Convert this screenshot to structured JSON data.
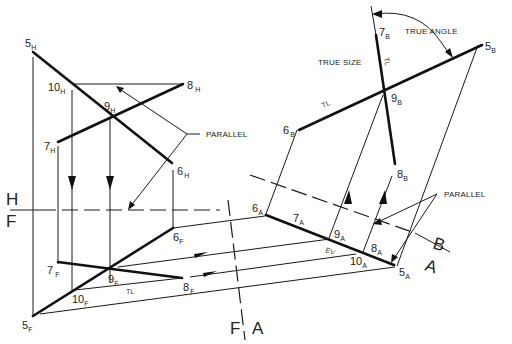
{
  "figure": {
    "views": {
      "horizontal": {
        "name": "H",
        "points": [
          {
            "id": "5H",
            "num": "5",
            "sub": "H"
          },
          {
            "id": "10H",
            "num": "10",
            "sub": "H"
          },
          {
            "id": "8H",
            "num": "8",
            "sub": "H"
          },
          {
            "id": "9H",
            "num": "9",
            "sub": "H"
          },
          {
            "id": "7H",
            "num": "7",
            "sub": "H"
          },
          {
            "id": "6H",
            "num": "6",
            "sub": "H"
          }
        ]
      },
      "frontal": {
        "name": "F",
        "points": [
          {
            "id": "6F",
            "num": "6",
            "sub": "F"
          },
          {
            "id": "7F",
            "num": "7",
            "sub": "F"
          },
          {
            "id": "9F",
            "num": "9",
            "sub": "F"
          },
          {
            "id": "8F",
            "num": "8",
            "sub": "F"
          },
          {
            "id": "10F",
            "num": "10",
            "sub": "F"
          },
          {
            "id": "5F",
            "num": "5",
            "sub": "F"
          }
        ]
      },
      "auxiliary_a": {
        "name": "A",
        "points": [
          {
            "id": "6A",
            "num": "6",
            "sub": "A"
          },
          {
            "id": "7A",
            "num": "7",
            "sub": "A"
          },
          {
            "id": "9A",
            "num": "9",
            "sub": "A"
          },
          {
            "id": "8A",
            "num": "8",
            "sub": "A"
          },
          {
            "id": "10A",
            "num": "10",
            "sub": "A"
          },
          {
            "id": "5A",
            "num": "5",
            "sub": "A"
          }
        ]
      },
      "auxiliary_b": {
        "name": "B",
        "points": [
          {
            "id": "7B",
            "num": "7",
            "sub": "B"
          },
          {
            "id": "5B",
            "num": "5",
            "sub": "B"
          },
          {
            "id": "6B",
            "num": "6",
            "sub": "B"
          },
          {
            "id": "9B",
            "num": "9",
            "sub": "B"
          },
          {
            "id": "8B",
            "num": "8",
            "sub": "B"
          }
        ]
      }
    },
    "fold_lines": {
      "hf": {
        "top": "H",
        "bottom": "F"
      },
      "fa": {
        "left": "F",
        "right": "A"
      },
      "ab": {
        "top": "B",
        "bottom": "A"
      }
    },
    "annotations": {
      "true_angle": "TRUE ANGLE",
      "true_size": "TRUE SIZE",
      "parallel_1": "PARALLEL",
      "parallel_2": "PARALLEL",
      "tl": "TL",
      "ev": "EV"
    }
  }
}
